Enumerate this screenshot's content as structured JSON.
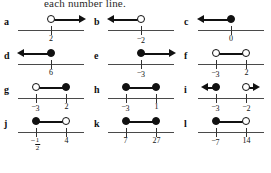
{
  "header": {
    "instruction_text": "each number line."
  },
  "style": {
    "line_color": "#4a4a4a",
    "mark_color": "#111111",
    "background": "#ffffff"
  },
  "items": [
    {
      "letter": "a",
      "points": [
        {
          "label": "2",
          "negative": false,
          "fill": "open",
          "pos": 50
        }
      ],
      "direction": "right",
      "kind": "ray"
    },
    {
      "letter": "b",
      "points": [
        {
          "label": "2",
          "negative": true,
          "fill": "open",
          "pos": 50
        }
      ],
      "direction": "left",
      "kind": "ray"
    },
    {
      "letter": "c",
      "points": [
        {
          "label": "0",
          "negative": false,
          "fill": "closed",
          "pos": 50
        }
      ],
      "direction": "left",
      "kind": "ray"
    },
    {
      "letter": "d",
      "points": [
        {
          "label": "6",
          "negative": false,
          "fill": "closed",
          "pos": 50
        }
      ],
      "direction": "left",
      "kind": "ray"
    },
    {
      "letter": "e",
      "points": [
        {
          "label": "3",
          "negative": true,
          "fill": "closed",
          "pos": 50
        }
      ],
      "direction": "right",
      "kind": "ray"
    },
    {
      "letter": "f",
      "points": [
        {
          "label": "3",
          "negative": true,
          "fill": "open",
          "pos": 28
        },
        {
          "label": "2",
          "negative": false,
          "fill": "open",
          "pos": 72
        }
      ],
      "direction": "none",
      "kind": "segment"
    },
    {
      "letter": "g",
      "points": [
        {
          "label": "3",
          "negative": true,
          "fill": "open",
          "pos": 28
        },
        {
          "label": "2",
          "negative": false,
          "fill": "closed",
          "pos": 72
        }
      ],
      "direction": "none",
      "kind": "segment"
    },
    {
      "letter": "h",
      "points": [
        {
          "label": "3",
          "negative": true,
          "fill": "closed",
          "pos": 28
        },
        {
          "label": "1",
          "negative": false,
          "fill": "closed",
          "pos": 72
        }
      ],
      "direction": "none",
      "kind": "segment"
    },
    {
      "letter": "i",
      "points": [
        {
          "label": "3",
          "negative": true,
          "fill": "closed",
          "pos": 28
        },
        {
          "label": "2",
          "negative": true,
          "fill": "open",
          "pos": 72
        }
      ],
      "direction": "both-out",
      "kind": "two-rays"
    },
    {
      "letter": "j",
      "points": [
        {
          "label": "1/2",
          "negative": true,
          "fill": "closed",
          "pos": 28,
          "fraction": {
            "num": "1",
            "den": "2"
          }
        },
        {
          "label": "4",
          "negative": false,
          "fill": "open",
          "pos": 72
        }
      ],
      "direction": "none",
      "kind": "segment"
    },
    {
      "letter": "k",
      "points": [
        {
          "label": "7",
          "negative": false,
          "fill": "closed",
          "pos": 28
        },
        {
          "label": "27",
          "negative": false,
          "fill": "closed",
          "pos": 72
        }
      ],
      "direction": "none",
      "kind": "segment"
    },
    {
      "letter": "l",
      "points": [
        {
          "label": "7",
          "negative": true,
          "fill": "closed",
          "pos": 28
        },
        {
          "label": "14",
          "negative": false,
          "fill": "open",
          "pos": 72
        }
      ],
      "direction": "none",
      "kind": "segment"
    }
  ]
}
